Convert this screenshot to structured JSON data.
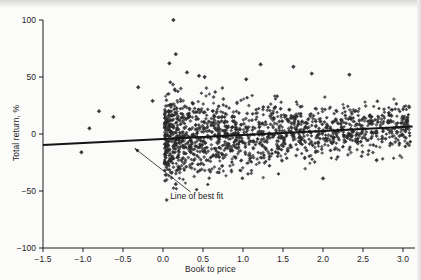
{
  "chart_data": {
    "type": "scatter",
    "title": "",
    "xlabel": "Book to price",
    "ylabel": "Total return, %",
    "xlim": [
      -1.5,
      3.15
    ],
    "ylim": [
      -100,
      100
    ],
    "xticks": [
      -1.5,
      -1.0,
      -0.5,
      0.0,
      0.5,
      1.0,
      1.5,
      2.0,
      2.5,
      3.0
    ],
    "xticklabels": [
      "−1.5",
      "−1.0",
      "−0.5",
      "0.0",
      "0.5",
      "1.0",
      "1.5",
      "2.0",
      "2.5",
      "3.0"
    ],
    "yticks": [
      -100,
      -50,
      0,
      50,
      100
    ],
    "yticklabels": [
      "−100",
      "−50",
      "0",
      "50",
      "100"
    ],
    "grid": false,
    "legend": null,
    "marker": "diamond",
    "marker_color": "#2b2b2b",
    "point_count": 1500,
    "annotations": [
      {
        "text": "Line of best fit",
        "x": 0.42,
        "y": -57,
        "arrow_to_x": -0.38,
        "arrow_to_y": -9
      }
    ],
    "series": [
      {
        "name": "Line of best fit",
        "type": "line",
        "color": "#141414",
        "x": [
          -1.5,
          3.12
        ],
        "y": [
          -9.6,
          6.6
        ]
      },
      {
        "name": "Stocks",
        "type": "scatter",
        "description": "Dense cloud of individual stocks between book-to-price 0 and 3.1, total return mostly between -30% and +35%, with scatter narrowing as book-to-price rises; a few sparse outliers at negative book-to-price.",
        "outliers": [
          {
            "x": -1.02,
            "y": -16
          },
          {
            "x": -0.92,
            "y": 5
          },
          {
            "x": -0.8,
            "y": 20
          },
          {
            "x": -0.62,
            "y": 15
          },
          {
            "x": -0.31,
            "y": 41
          },
          {
            "x": -0.13,
            "y": 29
          },
          {
            "x": 0.13,
            "y": 100
          },
          {
            "x": 0.16,
            "y": 70
          },
          {
            "x": 0.08,
            "y": 62
          },
          {
            "x": 0.3,
            "y": 54
          },
          {
            "x": 0.45,
            "y": 51
          },
          {
            "x": 0.52,
            "y": 50
          },
          {
            "x": 1.04,
            "y": 48
          },
          {
            "x": 1.22,
            "y": 61
          },
          {
            "x": 1.63,
            "y": 59
          },
          {
            "x": 1.86,
            "y": 53
          },
          {
            "x": 2.33,
            "y": 52
          },
          {
            "x": 2.0,
            "y": -39
          },
          {
            "x": 0.16,
            "y": -44
          },
          {
            "x": 0.74,
            "y": -28
          },
          {
            "x": 2.67,
            "y": -23
          }
        ]
      }
    ]
  }
}
